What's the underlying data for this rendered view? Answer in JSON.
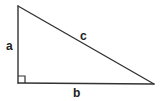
{
  "diagram": {
    "stroke_color": "#333333",
    "label_color": "#222222",
    "vertices": {
      "top": [
        18,
        6
      ],
      "right_angle": [
        18,
        83
      ],
      "bottom_right": [
        154,
        84
      ]
    },
    "right_angle_marker": {
      "size": 7
    },
    "labels": {
      "a": "a",
      "b": "b",
      "c": "c"
    }
  }
}
